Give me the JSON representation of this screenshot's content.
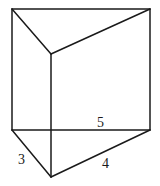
{
  "diagram": {
    "type": "triangular-prism",
    "vertices": {
      "top_left": [
        12,
        9
      ],
      "top_right": [
        150,
        9
      ],
      "top_front": [
        51,
        54
      ],
      "bottom_left": [
        12,
        130
      ],
      "bottom_right": [
        150,
        130
      ],
      "bottom_front": [
        51,
        177
      ]
    },
    "labels": {
      "back_edge": "5",
      "left_edge": "3",
      "front_edge": "4"
    }
  }
}
